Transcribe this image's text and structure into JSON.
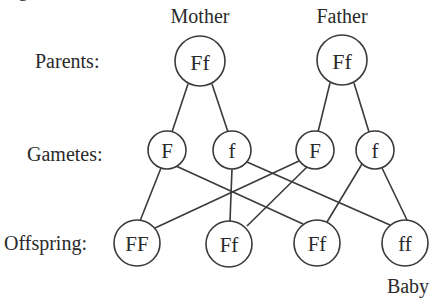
{
  "figure": {
    "cropped_title_fragment": "g"
  },
  "columns": {
    "mother_label": "Mother",
    "father_label": "Father"
  },
  "rows": {
    "parents_label": "Parents:",
    "gametes_label": "Gametes:",
    "offspring_label": "Offspring:"
  },
  "parents": [
    {
      "id": "mother",
      "genotype": "Ff"
    },
    {
      "id": "father",
      "genotype": "Ff"
    }
  ],
  "gametes": [
    {
      "id": "mother_F",
      "allele": "F",
      "from": "mother"
    },
    {
      "id": "mother_f",
      "allele": "f",
      "from": "mother"
    },
    {
      "id": "father_F",
      "allele": "F",
      "from": "father"
    },
    {
      "id": "father_f",
      "allele": "f",
      "from": "father"
    }
  ],
  "offspring": [
    {
      "id": "o1",
      "genotype": "FF",
      "from": [
        "mother_F",
        "father_F"
      ]
    },
    {
      "id": "o2",
      "genotype": "Ff",
      "from": [
        "mother_f",
        "father_F"
      ]
    },
    {
      "id": "o3",
      "genotype": "Ff",
      "from": [
        "mother_F",
        "father_f"
      ]
    },
    {
      "id": "o4",
      "genotype": "ff",
      "from": [
        "mother_f",
        "father_f"
      ]
    }
  ],
  "annotations": {
    "baby_label": "Baby"
  },
  "colors": {
    "line": "#3a3a3a",
    "text": "#2a2a2a",
    "background": "#ffffff"
  }
}
